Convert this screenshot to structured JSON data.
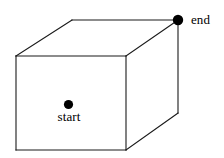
{
  "figure": {
    "name": "rectangular-box-start-end-diagram",
    "background_color": "#ffffff",
    "stroke_color": "#1a1a1a",
    "marker_color": "#000000",
    "canvas": {
      "width": 224,
      "height": 158
    }
  },
  "labels": {
    "start": "start",
    "end": "end"
  },
  "markers": [
    {
      "id": "start-point",
      "label": "start",
      "x": 68.5,
      "y": 104.5,
      "radius": 4.6,
      "color": "#000000",
      "label_position": "below"
    },
    {
      "id": "end-point",
      "label": "end",
      "x": 178,
      "y": 20,
      "radius": 5.2,
      "color": "#000000",
      "label_position": "right"
    }
  ],
  "geometry": {
    "vertices": {
      "front_top_left": {
        "x": 16,
        "y": 56
      },
      "front_top_right": {
        "x": 126,
        "y": 56
      },
      "front_bottom_right": {
        "x": 126,
        "y": 150
      },
      "front_bottom_left": {
        "x": 16,
        "y": 150
      },
      "back_top_left": {
        "x": 72,
        "y": 20
      },
      "back_top_right": {
        "x": 178,
        "y": 20
      },
      "back_bottom_right": {
        "x": 178,
        "y": 113
      }
    },
    "faces": {
      "front": "16,56 126,56 126,150 16,150",
      "top": "16,56 72,20 178,20 126,56",
      "right": "126,56 178,20 178,113 126,150"
    },
    "edges": [
      {
        "name": "front-top",
        "d": "M16,56 L126,56"
      },
      {
        "name": "front-right",
        "d": "M126,56 L126,150"
      },
      {
        "name": "front-bottom",
        "d": "M16,150 L126,150"
      },
      {
        "name": "front-left",
        "d": "M16,56 L16,150"
      },
      {
        "name": "top-left-diagonal",
        "d": "M16,56 L72,20"
      },
      {
        "name": "top-back",
        "d": "M72,20 L178,20"
      },
      {
        "name": "top-right-diagonal",
        "d": "M126,56 L178,20"
      },
      {
        "name": "back-right-vertical",
        "d": "M178,20 L178,113"
      },
      {
        "name": "bottom-right-diagonal",
        "d": "M126,150 L178,113"
      }
    ]
  }
}
